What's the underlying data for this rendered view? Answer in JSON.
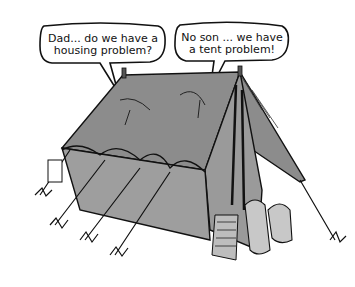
{
  "cartoon": {
    "bubbles": [
      {
        "speaker": "son",
        "lines": [
          "Dad... do we have a",
          "housing problem?"
        ]
      },
      {
        "speaker": "dad",
        "lines": [
          "No son ... we have",
          "a tent problem!"
        ]
      }
    ],
    "colors": {
      "tent": "#8c8c8c",
      "tent_dark": "#5a5a5a",
      "tent_light": "#b0b0b0",
      "ink": "#111111",
      "background": "#ffffff"
    }
  }
}
